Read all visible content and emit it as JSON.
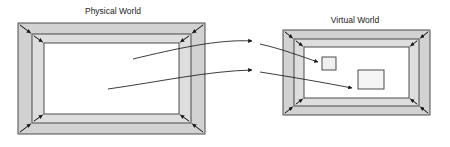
{
  "diagram": {
    "title_physical": "Physical World",
    "title_virtual": "Virtual World",
    "colors": {
      "outer_band": "#d2d2d2",
      "inner_band": "#dedede",
      "center_fill": "#ffffff",
      "stroke": "#3a3a3a",
      "arrow": "#1a1a1a",
      "text": "#1a1a1a",
      "background": "#ffffff"
    },
    "panels": [
      {
        "id": "physical-world",
        "label": "Physical World",
        "label_x": 113,
        "label_y": 14,
        "outer": {
          "x": 18,
          "y": 23,
          "w": 187,
          "h": 111
        },
        "mid": {
          "x": 32,
          "y": 34,
          "w": 159,
          "h": 89
        },
        "inner": {
          "x": 44,
          "y": 43,
          "w": 135,
          "h": 71
        },
        "corner_arrow_count": 8
      },
      {
        "id": "virtual-world",
        "label": "Virtual World",
        "label_x": 355,
        "label_y": 23,
        "outer": {
          "x": 283,
          "y": 30,
          "w": 147,
          "h": 85
        },
        "mid": {
          "x": 294,
          "y": 39,
          "w": 125,
          "h": 67
        },
        "inner": {
          "x": 304,
          "y": 47,
          "w": 105,
          "h": 51
        },
        "corner_arrow_count": 8
      }
    ],
    "objects": [
      {
        "id": "small-square",
        "x": 322,
        "y": 57,
        "w": 14,
        "h": 13
      },
      {
        "id": "large-square",
        "x": 358,
        "y": 70,
        "w": 26,
        "h": 19
      }
    ],
    "mapping_arrows": [
      {
        "id": "mapping-arrow-upper",
        "from_label": "physical-inner-upper",
        "to_label": "virtual-small-square",
        "path": "M 133 59 C 175 49 215 40 250 41",
        "arrowhead_at": {
          "x": 250,
          "y": 41
        }
      },
      {
        "id": "mapping-arrow-lower",
        "from_label": "physical-inner-lower",
        "to_label": "virtual-large-square",
        "path": "M 108 89 C 155 82 205 72 250 70",
        "arrowhead_at": {
          "x": 250,
          "y": 70
        }
      },
      {
        "id": "mapping-arrow-into-small-square",
        "from_label": "virtual-entry-upper",
        "to_label": "small-square",
        "path": "M 258 45 C 280 50 300 55 318 62",
        "arrowhead_at": {
          "x": 318,
          "y": 62
        }
      },
      {
        "id": "mapping-arrow-into-large-square",
        "from_label": "virtual-entry-lower",
        "to_label": "large-square",
        "path": "M 258 71 C 290 76 325 82 352 87",
        "arrowhead_at": {
          "x": 352,
          "y": 87
        }
      }
    ]
  }
}
